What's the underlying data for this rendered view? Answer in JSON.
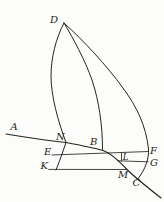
{
  "diagram": {
    "type": "geometric-engraving-figure",
    "background_color": "#fcfcfa",
    "ink_color": "#242424",
    "labels": {
      "D": "D",
      "A": "A",
      "N": "N",
      "B": "B",
      "E": "E",
      "F": "F",
      "L": "L",
      "G": "G",
      "K": "K",
      "M": "M",
      "C": "C"
    },
    "paths": {
      "curve_left": "M64,23 C56,38 51,58 51,76 C51,96 58,121 66,142.5 C63,152 59.5,161 56,170",
      "curve_middle": "M64,23 C73,38 85,60 92,80 C99,101 102.5,125 102.5,149.5",
      "curve_right": "M64,23 C84,41 107,66 123,88 C137,107 146,126 148.5,149 C149,158 146,169 137,180",
      "curve_base": "M6,134 C30,138 52,141 66,142.5 C82,145.5 96,148.5 103,150.5 C111,153 120,162 127,169.5 C133,175.5 147,187 161,198",
      "line_ef": "M52,155 L148.5,151.5",
      "line_lg": "M117.5,160.8 L148,161.8",
      "line_km": "M48.7,169.4 L127,169.5",
      "tick_l": "M121.5,153.2 L121.5,161"
    }
  }
}
